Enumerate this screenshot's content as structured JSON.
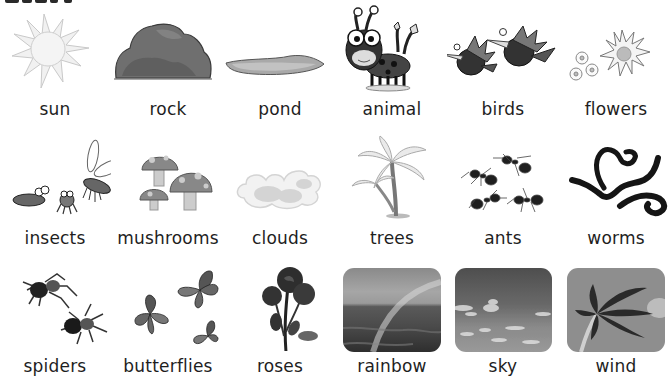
{
  "page": {
    "heading_visible": false
  },
  "rows": [
    {
      "items": [
        {
          "label": "sun",
          "icon": "sun-icon"
        },
        {
          "label": "rock",
          "icon": "rock-icon"
        },
        {
          "label": "pond",
          "icon": "pond-icon"
        },
        {
          "label": "animal",
          "icon": "animal-icon"
        },
        {
          "label": "birds",
          "icon": "birds-icon"
        },
        {
          "label": "flowers",
          "icon": "flowers-icon"
        }
      ]
    },
    {
      "items": [
        {
          "label": "insects",
          "icon": "insects-icon"
        },
        {
          "label": "mushrooms",
          "icon": "mushrooms-icon"
        },
        {
          "label": "clouds",
          "icon": "clouds-icon"
        },
        {
          "label": "trees",
          "icon": "trees-icon"
        },
        {
          "label": "ants",
          "icon": "ants-icon"
        },
        {
          "label": "worms",
          "icon": "worms-icon"
        }
      ]
    },
    {
      "items": [
        {
          "label": "spiders",
          "icon": "spiders-icon"
        },
        {
          "label": "butterflies",
          "icon": "butterflies-icon"
        },
        {
          "label": "roses",
          "icon": "roses-icon"
        },
        {
          "label": "rainbow",
          "icon": "rainbow-photo"
        },
        {
          "label": "sky",
          "icon": "sky-photo"
        },
        {
          "label": "wind",
          "icon": "wind-photo"
        }
      ]
    }
  ],
  "colors": {
    "text": "#1e1e1e",
    "background": "#ffffff"
  }
}
